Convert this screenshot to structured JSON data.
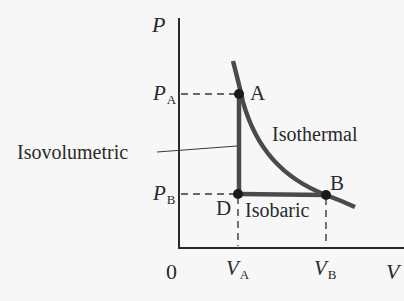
{
  "diagram": {
    "type": "PV diagram",
    "axes": {
      "y_label": "P",
      "x_label": "V",
      "origin_label": "0"
    },
    "ticks": {
      "pa": {
        "main": "P",
        "sub": "A"
      },
      "pb": {
        "main": "P",
        "sub": "B"
      },
      "va": {
        "main": "V",
        "sub": "A"
      },
      "vb": {
        "main": "V",
        "sub": "B"
      }
    },
    "points": {
      "a": "A",
      "b": "B",
      "d": "D"
    },
    "processes": {
      "isothermal": "Isothermal",
      "isovolumetric": "Isovolumetric",
      "isobaric": "Isobaric"
    },
    "colors": {
      "axis": "#2a2a2a",
      "process_line": "#4a4a4a",
      "background": "#f7f7f7"
    }
  }
}
